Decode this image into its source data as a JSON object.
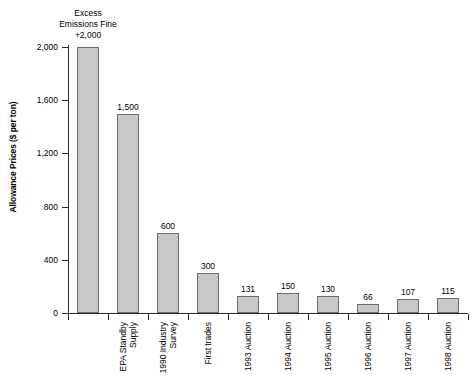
{
  "chart_data": {
    "type": "bar",
    "title": "",
    "subtitle": "",
    "xlabel": "",
    "ylabel": "Allowance Prices ($ per ton)",
    "ylim": [
      0,
      2000
    ],
    "yticks": [
      "0",
      "400",
      "800",
      "1,200",
      "1,600",
      "2,000"
    ],
    "ytick_values": [
      0,
      400,
      800,
      1200,
      1600,
      2000
    ],
    "grid": false,
    "legend": "none",
    "bar_color": "#c9c9c9",
    "bar_edge_color": "#6e6e6e",
    "axis_color": "#2b2b2b",
    "categories": [
      "Excess Emissions Fine",
      "EPA Standby Supply",
      "1990 Industry Survey",
      "First trades",
      "1993 Auction",
      "1994 Auction",
      "1995 Auction",
      "1996 Auction",
      "1997 Auction",
      "1998 Auction"
    ],
    "values": [
      2000,
      1500,
      600,
      300,
      131,
      150,
      130,
      66,
      107,
      115
    ],
    "value_labels": [
      "+2,000",
      "1,500",
      "600",
      "300",
      "131",
      "150",
      "130",
      "66",
      "107",
      "115"
    ],
    "category_label_lines": [
      [
        "Excess",
        "Emissions Fine"
      ],
      [
        "EPA Standby",
        "Supply"
      ],
      [
        "1990 Industry",
        "Survey"
      ],
      [
        "First trades"
      ],
      [
        "1993 Auction"
      ],
      [
        "1994 Auction"
      ],
      [
        "1995 Auction"
      ],
      [
        "1996 Auction"
      ],
      [
        "1997 Auction"
      ],
      [
        "1998 Auction"
      ]
    ],
    "first_bar_header_lines": [
      "Excess",
      "Emissions Fine"
    ]
  }
}
